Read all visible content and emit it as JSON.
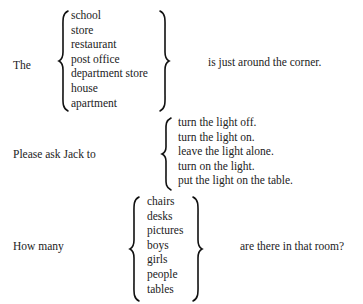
{
  "blocks": [
    {
      "lead": "The",
      "options": [
        "school",
        "store",
        "restaurant",
        "post office",
        "department store",
        "house",
        "apartment"
      ],
      "tail": "is just around the corner."
    },
    {
      "lead": "Please ask Jack to",
      "options": [
        "turn the light off.",
        "turn the light on.",
        "leave the light alone.",
        "turn on the light.",
        "put the light on the table."
      ],
      "tail": ""
    },
    {
      "lead": "How many",
      "options": [
        "chairs",
        "desks",
        "pictures",
        "boys",
        "girls",
        "people",
        "tables"
      ],
      "tail": "are there in that room?"
    }
  ]
}
